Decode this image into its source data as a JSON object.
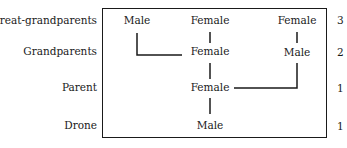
{
  "generations": [
    {
      "label": "Great-grandparents",
      "count": "3"
    },
    {
      "label": "Grandparents",
      "count": "2"
    },
    {
      "label": "Parent",
      "count": "1"
    },
    {
      "label": "Drone",
      "count": "1"
    }
  ],
  "nodes": {
    "ggp_male": "Male",
    "ggp_female_1": "Female",
    "ggp_female_2": "Female",
    "gp_female": "Female",
    "gp_male": "Male",
    "parent_female": "Female",
    "drone_male": "Male"
  }
}
